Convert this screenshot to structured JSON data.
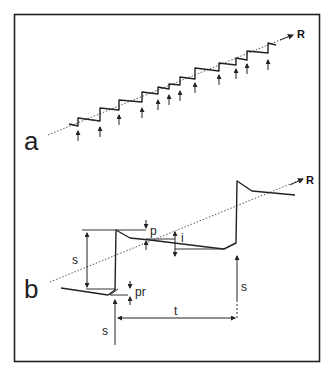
{
  "figure": {
    "panel_a": {
      "label": "a",
      "direction_label": "R",
      "description": "staircase trace of repeated stepwise advances along direction R, each step initiated by an arrow (stimulus)",
      "step_count": 15
    },
    "panel_b": {
      "label": "b",
      "direction_label": "R",
      "annotations": {
        "s_left": "s",
        "p": "p",
        "i": "i",
        "pr": "pr",
        "s_bottom": "s",
        "s_right": "s",
        "t": "t"
      }
    },
    "colors": {
      "line": "#222222",
      "background": "#ffffff"
    }
  }
}
